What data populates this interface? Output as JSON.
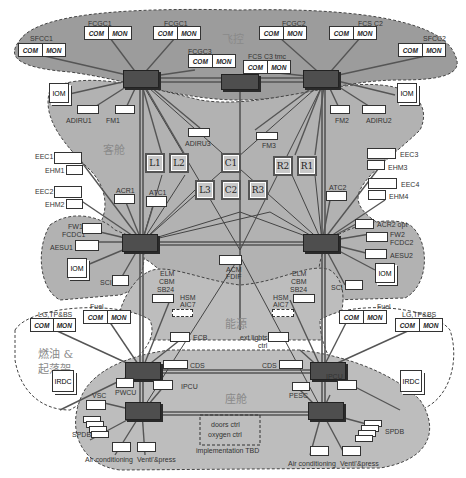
{
  "zones": {
    "flight": "飞控",
    "cabin": "客舱",
    "energy": "能源",
    "fuel_gear": [
      "燃油 &",
      "起落架"
    ],
    "cockpit_seat": "座舱"
  },
  "com_mon": {
    "com": "COM",
    "mon": "MON"
  },
  "flight_units": {
    "sfcc1": "SFCC1",
    "fcgc1a": "FCGC1",
    "fcgc1b": "FCGC1",
    "fcgc3": "FCGC3",
    "fcgc3_tmc": "FCS C3  tmc",
    "fcgc2a": "FCGC2",
    "fcgc2b": "FCS C2",
    "sfcc2": "SFCC2"
  },
  "cabin_units": {
    "iom_left": "IOM",
    "iom_right": "IOM",
    "adiru1": "ADIRU1",
    "fm1": "FM1",
    "adiru3": "ADIRU3",
    "fm3": "FM3",
    "fm2": "FM2",
    "adiru2": "ADIRU2"
  },
  "cabinets": [
    "L1",
    "L2",
    "L3",
    "C1",
    "C2",
    "R3",
    "R2",
    "R1"
  ],
  "engine_left": {
    "eec1": "EEC1",
    "ehm1": "EHM1",
    "eec2": "EEC2",
    "ehm2": "EHM2",
    "acr1": "ACR1",
    "atc1": "ATC1",
    "fw1": "FW1",
    "fcdc1": "FCDC1",
    "aesu1": "AESU1",
    "iom": "IOM",
    "sci": "SCI"
  },
  "engine_right": {
    "eec3": "EEC3",
    "ehm3": "EHM3",
    "eec4": "EEC4",
    "ehm4": "EHM4",
    "atc2": "ATC2",
    "acr2": "ACR2 opt",
    "fw2": "FW2",
    "fcdc2": "FCDC2",
    "aesu2": "AESU2",
    "iom": "IOM",
    "sci": "SCI"
  },
  "energy_units": {
    "acm_fdif": [
      "ACM",
      "FDIF"
    ],
    "blm_left": [
      "ELM",
      "CBM",
      "SB24"
    ],
    "blm_right": [
      "ELM",
      "CBM",
      "SB24"
    ],
    "hsm_left": [
      "HSM",
      "AIC7"
    ],
    "hsm_right": [
      "HSM",
      "AIC7"
    ]
  },
  "fuel_units": {
    "lgtpbs_left": "LG,TP&BS",
    "fuel_left": "Fuel",
    "fuel_right": "Fuel",
    "lgtpbs_right": "LG,TP&BS",
    "irdc_left": "IRDC",
    "irdc_right": "IRDC",
    "ecb": "ECB",
    "ext_lights": [
      "ext lights",
      "ctrl"
    ],
    "cds_left": "CDS",
    "cds_right": "CDS",
    "pwcu": "PWCU",
    "ipcu_left": "IPCU",
    "ipcu_right": "IPCU",
    "pesc": "PESC"
  },
  "cockpit_units": {
    "vsc": "VSC",
    "spdb_left": "SPDB",
    "spdb_right": "SPDB",
    "aircon_left": "Air conditioning",
    "vent_left": "Venti'&press",
    "aircon_right": "Air conditioning",
    "vent_right": "Venti'&press",
    "doors": [
      "doors ctrl",
      "oxygen ctrl"
    ],
    "impl": "implementation TBD"
  },
  "colors": {
    "zone_dark": "#9a9a9a",
    "zone_mid": "#b4b4b4",
    "zone_light": "#c6c6c6",
    "switch": "#4e4e4e",
    "link": "#555555"
  }
}
